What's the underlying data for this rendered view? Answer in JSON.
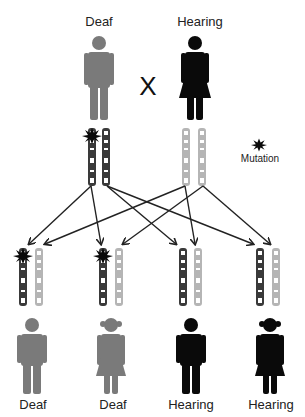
{
  "parents": {
    "father": {
      "label": "Deaf",
      "sex": "male",
      "phenotype": "deaf",
      "color": "#7a7a7a"
    },
    "mother": {
      "label": "Hearing",
      "sex": "female",
      "phenotype": "hearing",
      "color": "#0a0a0a"
    },
    "cross_symbol": "X"
  },
  "legend": {
    "mutation_label": "Mutation",
    "mutation_icon": "starburst-icon"
  },
  "chromosome_colors": {
    "dark": "#3a3a3a",
    "light": "#b5b5b5",
    "band": "#ffffff"
  },
  "children": [
    {
      "label": "Deaf",
      "sex": "male",
      "color": "#7a7a7a",
      "mutation": true
    },
    {
      "label": "Deaf",
      "sex": "female",
      "color": "#7a7a7a",
      "mutation": true
    },
    {
      "label": "Hearing",
      "sex": "male",
      "color": "#0a0a0a",
      "mutation": false
    },
    {
      "label": "Hearing",
      "sex": "female",
      "color": "#0a0a0a",
      "mutation": false
    }
  ]
}
